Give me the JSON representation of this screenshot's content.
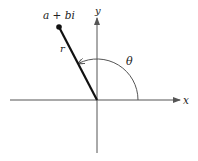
{
  "diagram": {
    "point_label": "a + bi",
    "radius_label": "r",
    "angle_label": "θ",
    "x_axis_label": "x",
    "y_axis_label": "y",
    "colors": {
      "axis": "#555555",
      "segment": "#111111",
      "text": "#222222",
      "background": "#ffffff"
    }
  }
}
